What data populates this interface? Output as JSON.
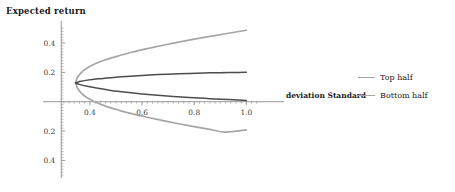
{
  "chart_data": {
    "type": "line",
    "title": "",
    "ylabel": "Expected return",
    "xlabel": "deviation Standard",
    "xlim": [
      0.22,
      1.06
    ],
    "ylim": [
      -0.52,
      0.55
    ],
    "xticks": [
      "0.4",
      "0.6",
      "0.8",
      "1.0"
    ],
    "xtick_values": [
      0.4,
      0.6,
      0.8,
      1.0
    ],
    "yticks": [
      "0.4",
      "0.2",
      "0.2",
      "0.4"
    ],
    "ytick_values": [
      0.4,
      0.2,
      -0.2,
      -0.4
    ],
    "grid": false,
    "legend_position": "right",
    "vertex": {
      "x": 0.345,
      "y": 0.128
    },
    "series": [
      {
        "name": "Top half",
        "color": "#a6a6a6",
        "branch": "upper",
        "points": [
          [
            0.345,
            0.128
          ],
          [
            0.352,
            0.165
          ],
          [
            0.365,
            0.195
          ],
          [
            0.385,
            0.225
          ],
          [
            0.42,
            0.258
          ],
          [
            0.46,
            0.286
          ],
          [
            0.51,
            0.313
          ],
          [
            0.56,
            0.337
          ],
          [
            0.62,
            0.362
          ],
          [
            0.68,
            0.385
          ],
          [
            0.74,
            0.406
          ],
          [
            0.8,
            0.426
          ],
          [
            0.86,
            0.445
          ],
          [
            0.92,
            0.463
          ],
          [
            1.0,
            0.487
          ]
        ]
      },
      {
        "name": "Top half",
        "color": "#a6a6a6",
        "branch": "lower",
        "points": [
          [
            0.345,
            0.128
          ],
          [
            0.352,
            0.092
          ],
          [
            0.365,
            0.062
          ],
          [
            0.385,
            0.032
          ],
          [
            0.42,
            -0.002
          ],
          [
            0.46,
            -0.03
          ],
          [
            0.51,
            -0.057
          ],
          [
            0.56,
            -0.081
          ],
          [
            0.62,
            -0.106
          ],
          [
            0.68,
            -0.129
          ],
          [
            0.74,
            -0.15
          ],
          [
            0.8,
            -0.17
          ],
          [
            0.86,
            -0.189
          ],
          [
            0.92,
            -0.207
          ],
          [
            1.0,
            -0.192
          ]
        ]
      },
      {
        "name": "Bottom half",
        "color": "#4d4d4d",
        "branch": "upper",
        "points": [
          [
            0.345,
            0.128
          ],
          [
            0.36,
            0.137
          ],
          [
            0.39,
            0.147
          ],
          [
            0.43,
            0.156
          ],
          [
            0.48,
            0.164
          ],
          [
            0.54,
            0.172
          ],
          [
            0.6,
            0.179
          ],
          [
            0.66,
            0.185
          ],
          [
            0.72,
            0.189
          ],
          [
            0.78,
            0.193
          ],
          [
            0.84,
            0.196
          ],
          [
            0.9,
            0.198
          ],
          [
            0.95,
            0.199
          ],
          [
            1.0,
            0.2
          ]
        ]
      },
      {
        "name": "Bottom half",
        "color": "#4d4d4d",
        "branch": "lower",
        "points": [
          [
            0.345,
            0.128
          ],
          [
            0.36,
            0.118
          ],
          [
            0.39,
            0.105
          ],
          [
            0.43,
            0.091
          ],
          [
            0.48,
            0.077
          ],
          [
            0.54,
            0.064
          ],
          [
            0.6,
            0.053
          ],
          [
            0.66,
            0.044
          ],
          [
            0.72,
            0.036
          ],
          [
            0.78,
            0.029
          ],
          [
            0.84,
            0.023
          ],
          [
            0.9,
            0.017
          ],
          [
            0.95,
            0.013
          ],
          [
            1.0,
            0.009
          ]
        ]
      }
    ]
  },
  "legend": {
    "items": [
      {
        "label": "Top half",
        "color": "#a6a6a6"
      },
      {
        "label": "Bottom half",
        "color": "#a6a6a6"
      }
    ]
  },
  "axes": {
    "axis_color": "#8c8c8c",
    "tick_color": "#8c8c8c"
  }
}
